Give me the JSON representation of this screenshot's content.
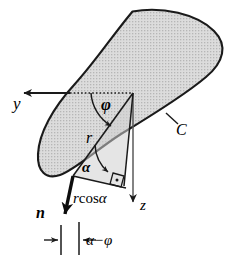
{
  "figure": {
    "type": "technical-line-diagram",
    "background_color": "#ffffff",
    "stroke_color": "#1a1a1a",
    "fill_color": "#d8d8d8",
    "labels": {
      "axis_y": "y",
      "axis_z": "z",
      "curve_c": "C",
      "angle_phi": "φ",
      "radius_r": "r",
      "angle_alpha": "α",
      "projection": "r cos α",
      "projection_prefix": "r",
      "projection_cos": "cos",
      "projection_suffix": "α",
      "normal_n": "n",
      "angle_difference": "α−φ"
    },
    "geometry": {
      "ellipse_center_x": 131,
      "ellipse_center_y": 91,
      "ellipse_rx": 95,
      "ellipse_ry": 48,
      "ellipse_rotation_deg": -31,
      "origin_x": 133,
      "origin_y": 93,
      "alpha_vertex_x": 73,
      "alpha_vertex_y": 176,
      "y_axis_arrow_tip_x": 17,
      "y_axis_arrow_tip_y": 93,
      "z_axis_arrow_tip_x": 133,
      "z_axis_arrow_tip_y": 209,
      "right_angle_marker_x": 118,
      "right_angle_marker_y": 180
    }
  }
}
